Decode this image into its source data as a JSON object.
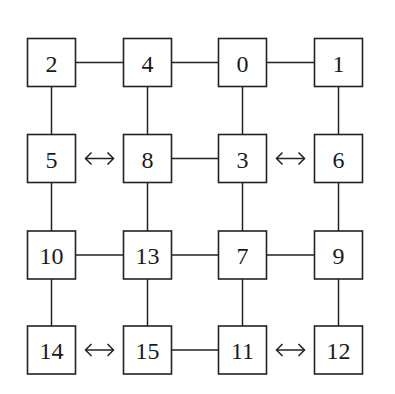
{
  "diagram": {
    "type": "grid-graph",
    "grid": [
      [
        "2",
        "4",
        "0",
        "1"
      ],
      [
        "5",
        "8",
        "3",
        "6"
      ],
      [
        "10",
        "13",
        "7",
        "9"
      ],
      [
        "14",
        "15",
        "11",
        "12"
      ]
    ],
    "edges": [
      {
        "from": "2",
        "to": "4",
        "kind": "line"
      },
      {
        "from": "4",
        "to": "0",
        "kind": "line"
      },
      {
        "from": "0",
        "to": "1",
        "kind": "line"
      },
      {
        "from": "5",
        "to": "8",
        "kind": "double-arrow"
      },
      {
        "from": "8",
        "to": "3",
        "kind": "line"
      },
      {
        "from": "3",
        "to": "6",
        "kind": "double-arrow"
      },
      {
        "from": "10",
        "to": "13",
        "kind": "line"
      },
      {
        "from": "13",
        "to": "7",
        "kind": "line"
      },
      {
        "from": "7",
        "to": "9",
        "kind": "line"
      },
      {
        "from": "14",
        "to": "15",
        "kind": "double-arrow"
      },
      {
        "from": "15",
        "to": "11",
        "kind": "line"
      },
      {
        "from": "11",
        "to": "12",
        "kind": "double-arrow"
      },
      {
        "from": "2",
        "to": "5",
        "kind": "line"
      },
      {
        "from": "5",
        "to": "10",
        "kind": "line"
      },
      {
        "from": "10",
        "to": "14",
        "kind": "line"
      },
      {
        "from": "4",
        "to": "8",
        "kind": "line"
      },
      {
        "from": "8",
        "to": "13",
        "kind": "line"
      },
      {
        "from": "13",
        "to": "15",
        "kind": "line"
      },
      {
        "from": "0",
        "to": "3",
        "kind": "line"
      },
      {
        "from": "3",
        "to": "7",
        "kind": "line"
      },
      {
        "from": "7",
        "to": "11",
        "kind": "line"
      },
      {
        "from": "1",
        "to": "6",
        "kind": "line"
      },
      {
        "from": "6",
        "to": "9",
        "kind": "line"
      },
      {
        "from": "9",
        "to": "12",
        "kind": "line"
      }
    ]
  }
}
